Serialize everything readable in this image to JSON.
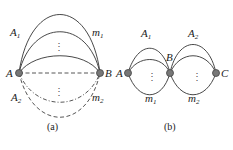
{
  "figures": [
    {
      "id": "a",
      "caption": "(a)",
      "nodes": [
        {
          "label": "A"
        },
        {
          "label": "B"
        }
      ],
      "edge_groups": [
        {
          "label_left": {
            "base": "A",
            "sub": "1"
          },
          "label_right": {
            "base": "m",
            "sub": "1"
          },
          "style": "solid"
        },
        {
          "label_left": {
            "base": "A",
            "sub": "2"
          },
          "label_right": {
            "base": "m",
            "sub": "2"
          },
          "style": "dashed"
        }
      ]
    },
    {
      "id": "b",
      "caption": "(b)",
      "nodes": [
        {
          "label": "A"
        },
        {
          "label": "B"
        },
        {
          "label": "C"
        }
      ],
      "edge_groups": [
        {
          "label_top": {
            "base": "A",
            "sub": "1"
          },
          "label_bottom": {
            "base": "m",
            "sub": "1"
          }
        },
        {
          "label_top": {
            "base": "A",
            "sub": "2"
          },
          "label_bottom": {
            "base": "m",
            "sub": "2"
          }
        }
      ]
    }
  ],
  "ellipsis": "⋮"
}
